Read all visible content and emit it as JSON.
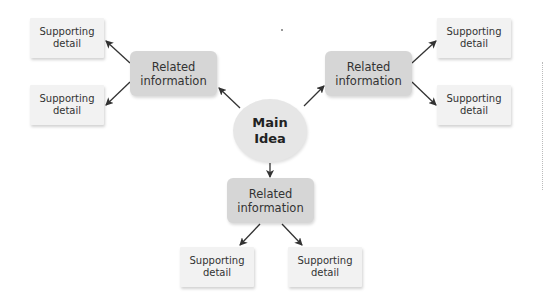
{
  "diagram": {
    "type": "concept-map",
    "main_idea": {
      "label": "Main\nIdea"
    },
    "branches": [
      {
        "position": "left",
        "label": "Related\ninformation",
        "details": [
          {
            "label": "Supporting\ndetail"
          },
          {
            "label": "Supporting\ndetail"
          }
        ]
      },
      {
        "position": "right",
        "label": "Related\ninformation",
        "details": [
          {
            "label": "Supporting\ndetail"
          },
          {
            "label": "Supporting\ndetail"
          }
        ]
      },
      {
        "position": "bottom",
        "label": "Related\ninformation",
        "details": [
          {
            "label": "Supporting\ndetail"
          },
          {
            "label": "Supporting\ndetail"
          }
        ]
      }
    ],
    "colors": {
      "main_fill": "#e6e6e6",
      "related_fill": "#d6d6d6",
      "support_fill": "#f2f2f2",
      "arrow": "#333333"
    }
  }
}
